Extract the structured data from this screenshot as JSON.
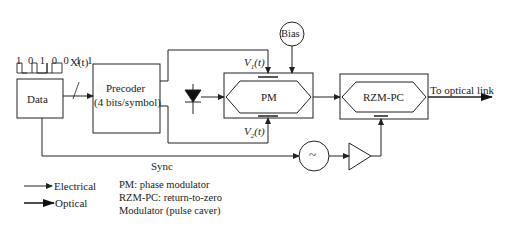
{
  "diagram": {
    "blocks": {
      "data": "Data",
      "precoder_line1": "Precoder",
      "precoder_line2": "(4 bits/symbol)",
      "pm": "PM",
      "bias": "Bias",
      "rzm_pc": "RZM-PC",
      "oscillator": "~"
    },
    "bit_pattern": "1 0 1 0 0 1 1",
    "signals": {
      "x_t": "X(t)",
      "v1_t": "V1(t)",
      "v1_main": "V",
      "v1_sub": "1",
      "v1_rest": "(t)",
      "v2_main": "V",
      "v2_sub": "2",
      "v2_rest": "(t)",
      "sync": "Sync",
      "output": "To optical link"
    },
    "legend": {
      "electrical": "Electrical",
      "optical": "Optical"
    },
    "notes": [
      "PM: phase modulator",
      "RZM-PC: return-to-zero",
      "Modulator (pulse caver)"
    ]
  }
}
